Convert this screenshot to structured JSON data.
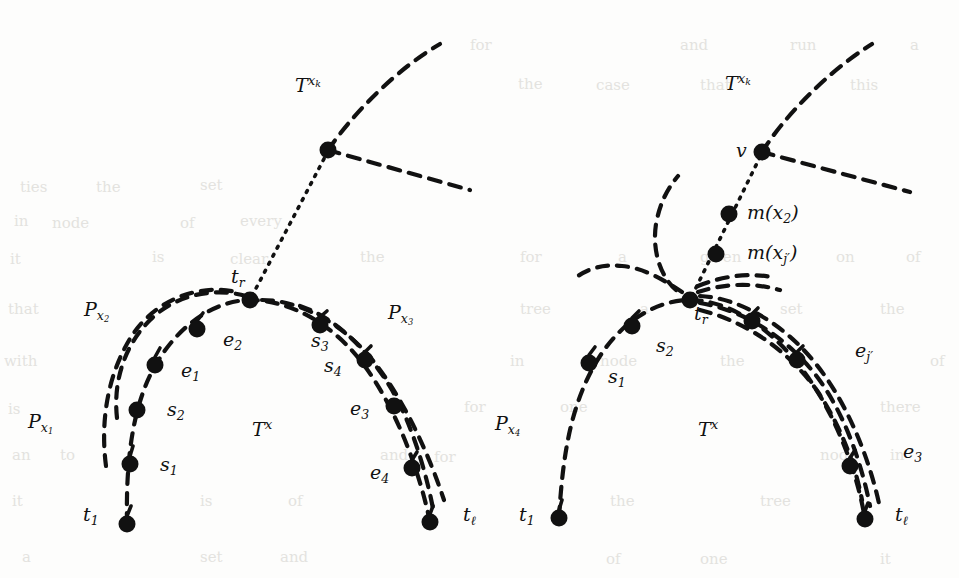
{
  "figure": {
    "width": 959,
    "height": 578,
    "background": "#fdfdfc",
    "ink": "#111111",
    "node_radius": 8.5,
    "dash_pattern": "11 9",
    "dot_pattern": "2 7",
    "stroke_width": 4.2
  },
  "panels": [
    {
      "id": "left",
      "name": "left-panel",
      "top_label": {
        "base": "T",
        "sup": "x",
        "sup_sub": "k",
        "x": 295,
        "y": 87
      },
      "branch_node": {
        "x": 328,
        "y": 150
      },
      "tr_node": {
        "x": 250,
        "y": 300
      },
      "tr_label": {
        "base": "t",
        "sub": "r",
        "x": 231,
        "y": 278
      },
      "tx_label": {
        "base": "T",
        "sup": "x",
        "x": 252,
        "y": 430
      },
      "t1_label": {
        "base": "t",
        "sub": "1",
        "x": 83,
        "y": 515
      },
      "tl_label": {
        "base": "t",
        "sub": "ℓ",
        "x": 463,
        "y": 511
      },
      "path_labels": [
        {
          "base": "P",
          "sub": "x",
          "sub_sub": "1",
          "x": 28,
          "y": 422
        },
        {
          "base": "P",
          "sub": "x",
          "sub_sub": "2",
          "x": 84,
          "y": 310
        },
        {
          "base": "P",
          "sub": "x",
          "sub_sub": "3",
          "x": 388,
          "y": 313
        }
      ],
      "node_labels": [
        {
          "base": "s",
          "sub": "1",
          "x": 160,
          "y": 465
        },
        {
          "base": "s",
          "sub": "2",
          "x": 167,
          "y": 410
        },
        {
          "base": "e",
          "sub": "1",
          "x": 181,
          "y": 371
        },
        {
          "base": "e",
          "sub": "2",
          "x": 223,
          "y": 340
        },
        {
          "base": "s",
          "sub": "3",
          "x": 311,
          "y": 341
        },
        {
          "base": "s",
          "sub": "4",
          "x": 324,
          "y": 366
        },
        {
          "base": "e",
          "sub": "3",
          "x": 350,
          "y": 409
        },
        {
          "base": "e",
          "sub": "4",
          "x": 370,
          "y": 473
        }
      ],
      "dots": [
        {
          "x": 328,
          "y": 150,
          "name": "branch-node"
        },
        {
          "x": 250,
          "y": 300,
          "name": "node-tr"
        },
        {
          "x": 197,
          "y": 329,
          "name": "node-e2"
        },
        {
          "x": 155,
          "y": 365,
          "name": "node-e1"
        },
        {
          "x": 137,
          "y": 410,
          "name": "node-s2"
        },
        {
          "x": 130,
          "y": 464,
          "name": "node-s1"
        },
        {
          "x": 127,
          "y": 524,
          "name": "node-t1"
        },
        {
          "x": 320,
          "y": 325,
          "name": "node-s3"
        },
        {
          "x": 365,
          "y": 360,
          "name": "node-s4"
        },
        {
          "x": 394,
          "y": 406,
          "name": "node-e3"
        },
        {
          "x": 412,
          "y": 468,
          "name": "node-e4"
        },
        {
          "x": 430,
          "y": 522,
          "name": "node-tl"
        }
      ]
    },
    {
      "id": "right",
      "name": "right-panel",
      "top_label": {
        "base": "T",
        "sup": "x",
        "sup_sub": "k",
        "x": 725,
        "y": 85
      },
      "v_node": {
        "x": 762,
        "y": 152
      },
      "v_label": {
        "base": "v",
        "x": 738,
        "y": 142
      },
      "m_labels": [
        {
          "text": "m(x",
          "sub": "2",
          "close": ")",
          "x": 748,
          "y": 205,
          "node_x": 729,
          "node_y": 214
        },
        {
          "text": "m(x",
          "sub": "j′",
          "close": ")",
          "x": 748,
          "y": 243,
          "node_x": 716,
          "node_y": 254
        }
      ],
      "tr_node": {
        "x": 690,
        "y": 300
      },
      "tr_label": {
        "base": "t",
        "sub": "r",
        "x": 696,
        "y": 313
      },
      "tx_label": {
        "base": "T",
        "sup": "x",
        "x": 698,
        "y": 430
      },
      "t1_label": {
        "base": "t",
        "sub": "1",
        "x": 519,
        "y": 515
      },
      "tl_label": {
        "base": "t",
        "sub": "ℓ",
        "x": 895,
        "y": 511
      },
      "path_labels": [
        {
          "base": "P",
          "sub": "x",
          "sub_sub": "4",
          "x": 495,
          "y": 423
        }
      ],
      "node_labels": [
        {
          "base": "s",
          "sub": "1",
          "x": 608,
          "y": 377
        },
        {
          "base": "s",
          "sub": "2",
          "x": 656,
          "y": 346
        },
        {
          "base": "e",
          "sub": "j′",
          "x": 855,
          "y": 351
        },
        {
          "base": "e",
          "sub": "3",
          "x": 903,
          "y": 452
        }
      ],
      "dots": [
        {
          "x": 762,
          "y": 152,
          "name": "node-v"
        },
        {
          "x": 729,
          "y": 214,
          "name": "node-mx2"
        },
        {
          "x": 716,
          "y": 254,
          "name": "node-mxj"
        },
        {
          "x": 690,
          "y": 300,
          "name": "node-tr"
        },
        {
          "x": 632,
          "y": 326,
          "name": "node-s2"
        },
        {
          "x": 589,
          "y": 363,
          "name": "node-s1"
        },
        {
          "x": 559,
          "y": 518,
          "name": "node-t1"
        },
        {
          "x": 752,
          "y": 321,
          "name": "node-right-a"
        },
        {
          "x": 797,
          "y": 360,
          "name": "node-right-b"
        },
        {
          "x": 850,
          "y": 466,
          "name": "node-right-c"
        },
        {
          "x": 865,
          "y": 519,
          "name": "node-tl"
        }
      ]
    }
  ],
  "background_text": [
    {
      "t": "ties",
      "x": 20,
      "y": 178
    },
    {
      "t": "the",
      "x": 96,
      "y": 178
    },
    {
      "t": "set",
      "x": 200,
      "y": 176
    },
    {
      "t": "for",
      "x": 470,
      "y": 36
    },
    {
      "t": "and",
      "x": 680,
      "y": 36
    },
    {
      "t": "run",
      "x": 790,
      "y": 36
    },
    {
      "t": "a",
      "x": 910,
      "y": 36
    },
    {
      "t": "in",
      "x": 14,
      "y": 212
    },
    {
      "t": "node",
      "x": 52,
      "y": 214
    },
    {
      "t": "of",
      "x": 180,
      "y": 214
    },
    {
      "t": "every",
      "x": 240,
      "y": 212
    },
    {
      "t": "the",
      "x": 518,
      "y": 75
    },
    {
      "t": "case",
      "x": 596,
      "y": 76
    },
    {
      "t": "that",
      "x": 700,
      "y": 76
    },
    {
      "t": "this",
      "x": 850,
      "y": 76
    },
    {
      "t": "it",
      "x": 10,
      "y": 250
    },
    {
      "t": "is",
      "x": 152,
      "y": 248
    },
    {
      "t": "clear",
      "x": 230,
      "y": 250
    },
    {
      "t": "the",
      "x": 360,
      "y": 248
    },
    {
      "t": "for",
      "x": 520,
      "y": 248
    },
    {
      "t": "a",
      "x": 618,
      "y": 248
    },
    {
      "t": "given",
      "x": 700,
      "y": 248
    },
    {
      "t": "on",
      "x": 836,
      "y": 248
    },
    {
      "t": "of",
      "x": 906,
      "y": 248
    },
    {
      "t": "that",
      "x": 8,
      "y": 300
    },
    {
      "t": "tree",
      "x": 520,
      "y": 300
    },
    {
      "t": "a",
      "x": 640,
      "y": 300
    },
    {
      "t": "set",
      "x": 780,
      "y": 300
    },
    {
      "t": "the",
      "x": 880,
      "y": 300
    },
    {
      "t": "with",
      "x": 4,
      "y": 352
    },
    {
      "t": "in",
      "x": 510,
      "y": 352
    },
    {
      "t": "node",
      "x": 600,
      "y": 352
    },
    {
      "t": "the",
      "x": 720,
      "y": 352
    },
    {
      "t": "of",
      "x": 930,
      "y": 352
    },
    {
      "t": "is",
      "x": 8,
      "y": 400
    },
    {
      "t": "for",
      "x": 464,
      "y": 398
    },
    {
      "t": "one",
      "x": 560,
      "y": 398
    },
    {
      "t": "there",
      "x": 880,
      "y": 398
    },
    {
      "t": "an",
      "x": 12,
      "y": 446
    },
    {
      "t": "to",
      "x": 60,
      "y": 446
    },
    {
      "t": "and",
      "x": 380,
      "y": 446
    },
    {
      "t": "for",
      "x": 434,
      "y": 448
    },
    {
      "t": "node",
      "x": 820,
      "y": 446
    },
    {
      "t": "in",
      "x": 890,
      "y": 446
    },
    {
      "t": "it",
      "x": 12,
      "y": 492
    },
    {
      "t": "is",
      "x": 200,
      "y": 492
    },
    {
      "t": "of",
      "x": 288,
      "y": 492
    },
    {
      "t": "the",
      "x": 610,
      "y": 492
    },
    {
      "t": "tree",
      "x": 760,
      "y": 492
    },
    {
      "t": "a",
      "x": 22,
      "y": 548
    },
    {
      "t": "set",
      "x": 200,
      "y": 548
    },
    {
      "t": "and",
      "x": 280,
      "y": 548
    },
    {
      "t": "of",
      "x": 606,
      "y": 550
    },
    {
      "t": "one",
      "x": 700,
      "y": 550
    },
    {
      "t": "it",
      "x": 880,
      "y": 550
    }
  ]
}
